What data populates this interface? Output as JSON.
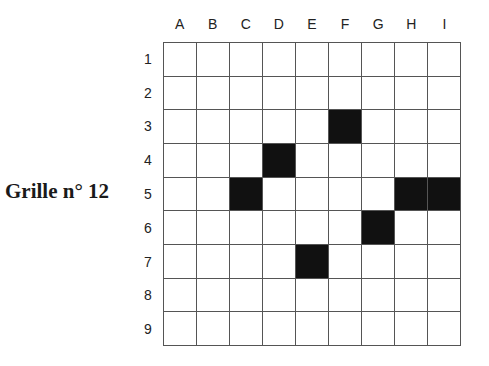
{
  "title": "Grille n° 12",
  "columns": [
    "A",
    "B",
    "C",
    "D",
    "E",
    "F",
    "G",
    "H",
    "I"
  ],
  "rows": [
    "1",
    "2",
    "3",
    "4",
    "5",
    "6",
    "7",
    "8",
    "9"
  ],
  "black_cells": [
    "F3",
    "D4",
    "C5",
    "H5",
    "I5",
    "G6",
    "E7"
  ],
  "colors": {
    "black_cell": "#111111",
    "white_cell": "#ffffff",
    "grid_line": "#555555"
  }
}
